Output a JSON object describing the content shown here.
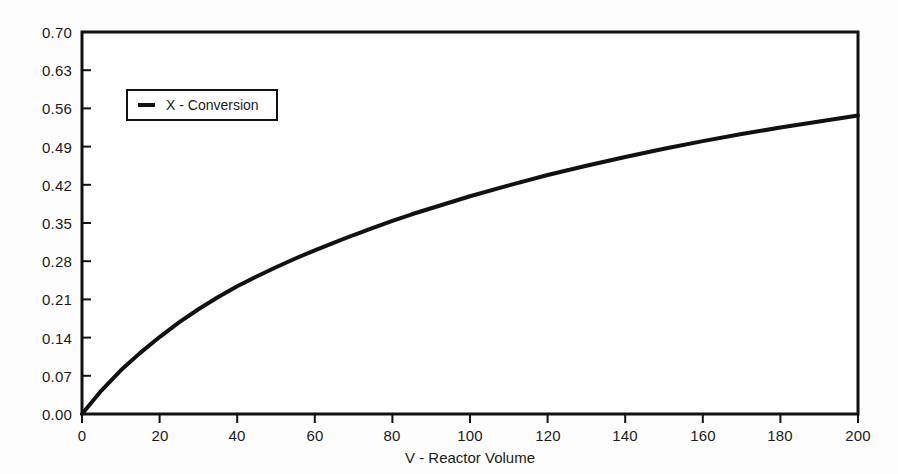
{
  "chart_data": {
    "type": "line",
    "title": "",
    "xlabel": "V - Reactor Volume",
    "ylabel": "",
    "xlim": [
      0,
      200
    ],
    "ylim": [
      0.0,
      0.7
    ],
    "grid": false,
    "legend_position": "top-left",
    "x_ticks": [
      "0",
      "20",
      "40",
      "60",
      "80",
      "100",
      "120",
      "140",
      "160",
      "180",
      "200"
    ],
    "y_ticks": [
      "0.00",
      "0.07",
      "0.14",
      "0.21",
      "0.28",
      "0.35",
      "0.42",
      "0.49",
      "0.56",
      "0.63",
      "0.70"
    ],
    "series": [
      {
        "name": "X - Conversion",
        "color": "#111111",
        "x": [
          0,
          5,
          10,
          15,
          20,
          25,
          30,
          35,
          40,
          45,
          50,
          55,
          60,
          65,
          70,
          75,
          80,
          85,
          90,
          95,
          100,
          110,
          120,
          130,
          140,
          150,
          160,
          170,
          180,
          190,
          200
        ],
        "values": [
          0.0,
          0.043,
          0.08,
          0.112,
          0.141,
          0.168,
          0.192,
          0.214,
          0.234,
          0.252,
          0.269,
          0.285,
          0.3,
          0.314,
          0.328,
          0.341,
          0.354,
          0.366,
          0.377,
          0.388,
          0.399,
          0.419,
          0.438,
          0.455,
          0.471,
          0.486,
          0.5,
          0.513,
          0.525,
          0.536,
          0.547
        ]
      }
    ]
  },
  "legend": {
    "entries": [
      {
        "label": "X - Conversion",
        "marker": "dash-line"
      }
    ]
  },
  "axes": {
    "x_title": "V - Reactor Volume",
    "y_title": ""
  }
}
